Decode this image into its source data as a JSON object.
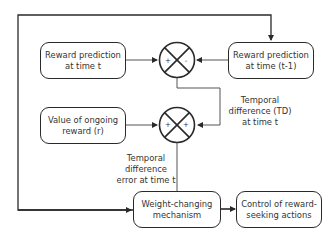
{
  "diagram": {
    "boxes": {
      "reward_pred_t": {
        "line1": "Reward prediction",
        "line2": "at time t"
      },
      "reward_pred_t1": {
        "line1": "Reward prediction",
        "line2": "at time (t-1)"
      },
      "ongoing_reward": {
        "line1": "Value of ongoing",
        "line2": "reward (r)"
      },
      "weight_changing": {
        "line1": "Weight-changing",
        "line2": "mechanism"
      },
      "control_actions": {
        "line1": "Control of reward-",
        "line2": "seeking actions"
      }
    },
    "summing_junctions": [
      {
        "id": "junction-1",
        "left_sign": "+",
        "right_sign": "-"
      },
      {
        "id": "junction-2",
        "left_sign": "+",
        "right_sign": "+"
      }
    ],
    "labels": {
      "td": {
        "line1": "Temporal",
        "line2": "difference (TD)",
        "line3": "at time t"
      },
      "td_error": {
        "line1": "Temporal",
        "line2": "difference",
        "line3": "error at time t"
      }
    },
    "colors": {
      "stroke": "#2a2a2a",
      "connector": "#555555",
      "text": "#333333"
    }
  }
}
